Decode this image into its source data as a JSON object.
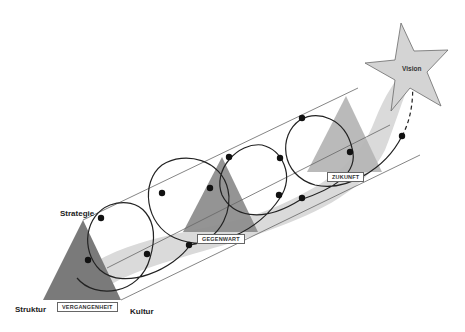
{
  "diagram": {
    "type": "process-spiral",
    "vertex_labels": {
      "top": "Strategie",
      "bottom_left": "Struktur",
      "bottom_right": "Kultur"
    },
    "phase_labels": [
      {
        "id": "past",
        "label": "VERGANGENHEIT"
      },
      {
        "id": "present",
        "label": "GEGENWART"
      },
      {
        "id": "future",
        "label": "ZUKUNFT"
      }
    ],
    "goal": {
      "shape": "star",
      "label": "Vision"
    },
    "colors": {
      "triangle_past": "#7a7a7a",
      "triangle_present": "#8c8c8c",
      "triangle_future": "#b4b4b4",
      "ribbon": "#d9d9d9",
      "star_fill": "#d4d4d4",
      "star_stroke": "#6a6a6a",
      "line": "#555555",
      "dot": "#111111"
    }
  }
}
